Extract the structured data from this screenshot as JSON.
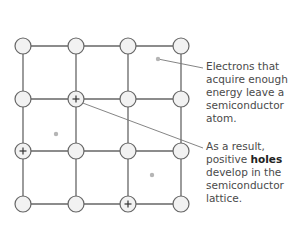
{
  "diagram": {
    "type": "semiconductor-lattice",
    "grid": {
      "cols_x": [
        23,
        76,
        128,
        181
      ],
      "rows_y": [
        46,
        99,
        151,
        204
      ],
      "node_radius": 8,
      "line_color": "#666666",
      "node_fill": "#f2f2f2"
    },
    "holes": [
      {
        "row": 1,
        "col": 1,
        "symbol": "+"
      },
      {
        "row": 2,
        "col": 0,
        "symbol": "+"
      },
      {
        "row": 3,
        "col": 2,
        "symbol": "+"
      }
    ],
    "free_electrons": [
      {
        "x": 158,
        "y": 59
      },
      {
        "x": 56,
        "y": 134
      },
      {
        "x": 152,
        "y": 175
      }
    ],
    "annotations": [
      {
        "id": "electrons",
        "text_lines": [
          "Electrons that",
          "acquire enough",
          "energy leave a",
          "semiconductor",
          "atom."
        ],
        "pointer_from": [
          158,
          59
        ],
        "pointer_to": [
          203,
          68
        ]
      },
      {
        "id": "holes",
        "text_pre": "As a result, positive ",
        "text_bold": "holes",
        "text_post": " develop in the semiconductor lattice.",
        "pointer_from": [
          80,
          102
        ],
        "pointer_to": [
          203,
          148
        ]
      }
    ]
  }
}
